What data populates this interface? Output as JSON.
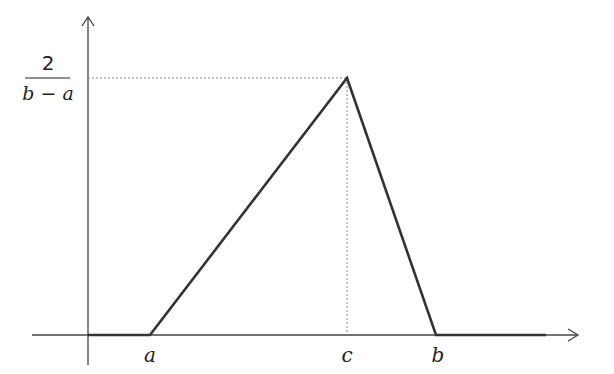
{
  "diagram": {
    "type": "triangular-distribution-pdf",
    "y_label": {
      "numerator": "2",
      "denominator": "b − a"
    },
    "x_ticks": [
      {
        "label": "a",
        "x": 150
      },
      {
        "label": "c",
        "x": 347
      },
      {
        "label": "b",
        "x": 436
      }
    ],
    "peak": {
      "x": 347,
      "y": 78
    },
    "colors": {
      "curve": "#333333",
      "axis": "#444444",
      "guide": "#888888"
    }
  }
}
